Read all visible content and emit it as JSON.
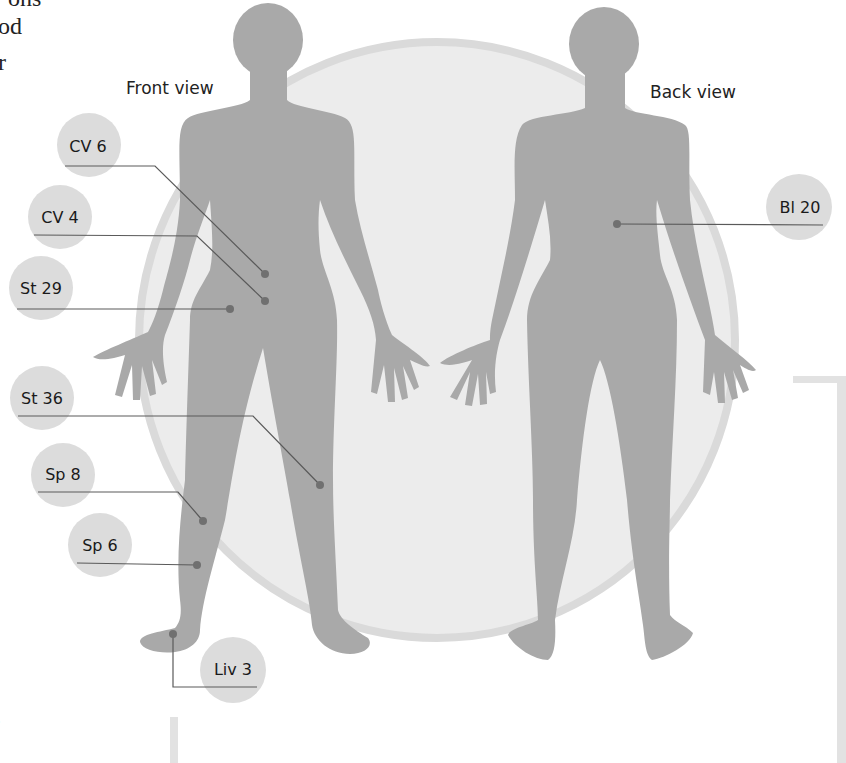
{
  "page_fragments": {
    "top_left_lines": [
      "ons",
      "od",
      "r"
    ],
    "bottom_left_mark": ","
  },
  "views": {
    "front_label": "Front view",
    "back_label": "Back view"
  },
  "acupoints": [
    {
      "label": "CV 6",
      "view": "front"
    },
    {
      "label": "CV 4",
      "view": "front"
    },
    {
      "label": "St 29",
      "view": "front"
    },
    {
      "label": "St 36",
      "view": "front"
    },
    {
      "label": "Sp 8",
      "view": "front"
    },
    {
      "label": "Sp 6",
      "view": "front"
    },
    {
      "label": "Liv 3",
      "view": "front"
    },
    {
      "label": "Bl 20",
      "view": "back"
    }
  ],
  "colors": {
    "figure": "#a9a9a9",
    "backdrop_circle": "#ececec",
    "backdrop_rim": "#dadada",
    "label_bubble": "#dcdcdc",
    "leader_line": "#5a5a5a",
    "point_dot": "#707070",
    "text": "#222222"
  }
}
